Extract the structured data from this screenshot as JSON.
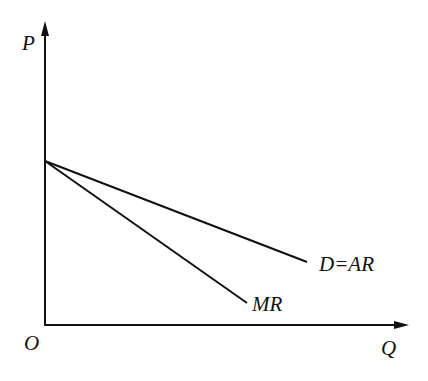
{
  "diagram": {
    "type": "monopoly-revenue-curves",
    "axes": {
      "y_label": "P",
      "x_label": "Q",
      "origin_label": "O"
    },
    "curves": [
      {
        "id": "demand",
        "label": "D=AR",
        "start": [
          45,
          161
        ],
        "end": [
          307,
          262
        ]
      },
      {
        "id": "marginal-revenue",
        "label": "MR",
        "start": [
          45,
          161
        ],
        "end": [
          247,
          303
        ]
      }
    ],
    "colors": {
      "line": "#111111",
      "background": "#ffffff"
    }
  }
}
